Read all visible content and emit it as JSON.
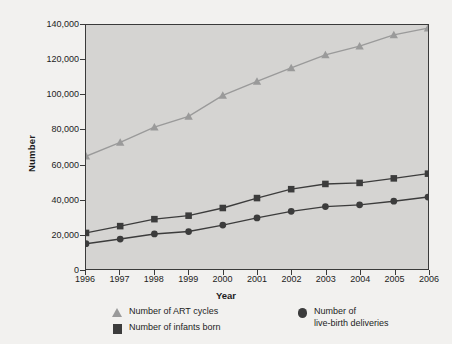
{
  "chart_data": {
    "type": "line",
    "title": "",
    "xlabel": "Year",
    "ylabel": "Number",
    "categories": [
      1996,
      1997,
      1998,
      1999,
      2000,
      2001,
      2002,
      2003,
      2004,
      2005,
      2006
    ],
    "x_tick_labels": [
      "1996",
      "1997",
      "1998",
      "1999",
      "2000",
      "2001",
      "2002",
      "2003",
      "2004",
      "2005",
      "2006"
    ],
    "y_tick_labels": [
      "0",
      "20,000",
      "40,000",
      "60,000",
      "80,000",
      "100,000",
      "120,000",
      "140,000"
    ],
    "y_tick_values": [
      0,
      20000,
      40000,
      60000,
      80000,
      100000,
      120000,
      140000
    ],
    "ylim": [
      0,
      140000
    ],
    "grid": false,
    "legend_position": "bottom",
    "series": [
      {
        "name": "Number of ART cycles",
        "marker": "triangle",
        "color": "#9a9a9a",
        "values": [
          64700,
          72600,
          81400,
          87600,
          99600,
          107600,
          115400,
          122900,
          127900,
          134300,
          138200
        ]
      },
      {
        "name": "Number of infants born",
        "marker": "square",
        "color": "#3c3c3c",
        "values": [
          20700,
          24600,
          28600,
          30600,
          35000,
          40700,
          45800,
          48800,
          49400,
          52000,
          54700
        ]
      },
      {
        "name": "Number of live-birth deliveries",
        "marker": "circle",
        "color": "#3c3c3c",
        "values": [
          14500,
          17200,
          20100,
          21500,
          25200,
          29300,
          33100,
          35800,
          36800,
          38900,
          41300
        ]
      }
    ]
  },
  "legend": {
    "entries": [
      {
        "label": "Number of ART cycles",
        "marker": "triangle"
      },
      {
        "label": "Number of infants born",
        "marker": "square"
      },
      {
        "label_line1": "Number of",
        "label_line2": "live-birth deliveries",
        "marker": "circle"
      }
    ]
  },
  "colors": {
    "plot_background": "#d5d4d2",
    "page_background": "#f2f1ef",
    "axis": "#3a3a3a",
    "series_light": "#9a9a9a",
    "series_dark": "#3c3c3c",
    "text": "#1d1d1d"
  }
}
